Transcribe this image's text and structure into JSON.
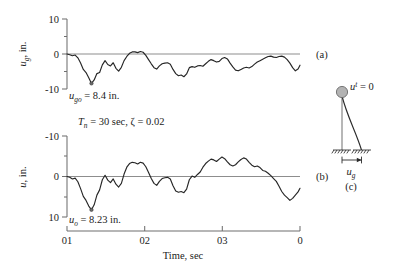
{
  "figure": {
    "title_visible": false,
    "panels": [
      {
        "id": "a",
        "label": "(a)"
      },
      {
        "id": "b",
        "label": "(b)"
      },
      {
        "id": "c",
        "label": "(c)"
      }
    ],
    "xaxis": {
      "label": "Time, sec",
      "tick_labels": [
        "01",
        "02",
        "03",
        "0"
      ],
      "tick_values": [
        0,
        10,
        20,
        30
      ]
    },
    "panel_a": {
      "ylabel_main": "u",
      "ylabel_sub": "g",
      "ylabel_unit": ", in.",
      "ytick_labels": [
        "10",
        "0",
        "-10"
      ],
      "annotation_main": "u",
      "annotation_sub": "go",
      "annotation_rest": " = 8.4 in."
    },
    "panel_b": {
      "ylabel_main": "u",
      "ylabel_unit": ", in.",
      "ytick_labels": [
        "-10",
        "0",
        "10"
      ],
      "annotation_main": "u",
      "annotation_sub": "o",
      "annotation_rest": " = 8.23 in.",
      "params_tn": "T",
      "params_tn_sub": "n",
      "params_tn_rest": " = 30 sec, ",
      "params_zeta": "ζ",
      "params_zeta_rest": " = 0.02"
    },
    "panel_c": {
      "mass_label_main": "u",
      "mass_label_sup": "t",
      "mass_label_rest": " = 0",
      "ground_label_main": "u",
      "ground_label_sub": "g"
    },
    "colors": {
      "curve": "#262626",
      "baseline": "#8d8d8d",
      "axis": "#6f6f6f",
      "mass_fill": "#b3b3b3",
      "text": "#1b1b1b"
    }
  },
  "chart_data": [
    {
      "type": "line",
      "id": "panel_a",
      "title": "Ground displacement history",
      "xlabel": "Time, sec",
      "ylabel": "u_g, in.",
      "xlim": [
        0,
        30
      ],
      "ylim": [
        -10,
        10
      ],
      "y_axis_direction": "normal",
      "ytick_values": [
        10,
        0,
        -10
      ],
      "ytick_labels": [
        "10",
        "0",
        "-10"
      ],
      "grid": false,
      "legend": "none",
      "panel_label": "(a)",
      "annotations": [
        {
          "text": "u_go = 8.4 in.",
          "x": 4.2,
          "y": -8.4,
          "note": "peak ground displacement"
        }
      ],
      "x": [
        0.0,
        0.35,
        0.7,
        1.05,
        1.4,
        1.75,
        2.1,
        2.45,
        2.8,
        3.15,
        3.5,
        3.85,
        4.2,
        4.55,
        4.9,
        5.25,
        5.6,
        5.95,
        6.3,
        6.65,
        7.0,
        7.35,
        7.7,
        8.05,
        8.4,
        8.75,
        9.1,
        9.45,
        9.8,
        10.15,
        10.5,
        10.85,
        11.2,
        11.55,
        11.9,
        12.25,
        12.6,
        12.95,
        13.3,
        13.65,
        14.0,
        14.35,
        14.7,
        15.05,
        15.4,
        15.75,
        16.1,
        16.45,
        16.8,
        17.15,
        17.5,
        17.85,
        18.2,
        18.55,
        18.9,
        19.25,
        19.6,
        19.95,
        20.3,
        20.65,
        21.0,
        21.35,
        21.7,
        22.05,
        22.4,
        22.75,
        23.1,
        23.45,
        23.8,
        24.15,
        24.5,
        24.85,
        25.2,
        25.55,
        25.9,
        26.25,
        26.6,
        26.95,
        27.3,
        27.65,
        28.0,
        28.35,
        28.7,
        29.05,
        29.4,
        29.75,
        30.0
      ],
      "values": [
        0.0,
        -0.2,
        -0.5,
        -0.3,
        -1.1,
        -2.6,
        -4.4,
        -5.3,
        -6.8,
        -8.4,
        -7.4,
        -5.6,
        -5.3,
        -3.1,
        -1.9,
        -3.0,
        -3.4,
        -2.5,
        -4.1,
        -4.9,
        -3.8,
        -1.9,
        -0.7,
        0.2,
        0.6,
        0.6,
        0.4,
        0.7,
        0.5,
        -0.4,
        -1.6,
        -2.8,
        -3.9,
        -4.3,
        -3.4,
        -2.8,
        -2.6,
        -2.5,
        -2.9,
        -4.4,
        -5.6,
        -6.2,
        -6.0,
        -6.5,
        -5.7,
        -3.9,
        -3.6,
        -3.8,
        -3.4,
        -3.3,
        -3.5,
        -2.8,
        -2.1,
        -1.6,
        -1.9,
        -2.3,
        -2.1,
        -1.3,
        -1.0,
        -1.4,
        -2.6,
        -3.7,
        -4.6,
        -4.8,
        -4.4,
        -4.0,
        -3.8,
        -4.0,
        -3.6,
        -2.9,
        -2.3,
        -1.9,
        -1.5,
        -1.1,
        -0.7,
        -0.6,
        -0.9,
        -1.0,
        -0.7,
        -0.6,
        -0.9,
        -1.6,
        -2.6,
        -3.9,
        -4.8,
        -4.3,
        -3.2
      ]
    },
    {
      "type": "line",
      "id": "panel_b",
      "title": "Structural displacement history (T_n = 30 sec, zeta = 0.02)",
      "xlabel": "Time, sec",
      "ylabel": "u, in.",
      "xlim": [
        0,
        30
      ],
      "ylim": [
        -10,
        10
      ],
      "y_axis_direction": "inverted",
      "ytick_values": [
        -10,
        0,
        10
      ],
      "ytick_labels": [
        "-10",
        "0",
        "10"
      ],
      "grid": false,
      "legend": "none",
      "panel_label": "(b)",
      "annotations": [
        {
          "text": "u_o = 8.23 in.",
          "x": 4.2,
          "y": 8.23,
          "note": "peak structural displacement"
        },
        {
          "text": "T_n = 30 sec, zeta = 0.02",
          "x": 8.0,
          "y": -13.0,
          "note": "system parameters"
        }
      ],
      "x": [
        0.0,
        0.35,
        0.7,
        1.05,
        1.4,
        1.75,
        2.1,
        2.45,
        2.8,
        3.15,
        3.5,
        3.85,
        4.2,
        4.55,
        4.9,
        5.25,
        5.6,
        5.95,
        6.3,
        6.65,
        7.0,
        7.35,
        7.7,
        8.05,
        8.4,
        8.75,
        9.1,
        9.45,
        9.8,
        10.15,
        10.5,
        10.85,
        11.2,
        11.55,
        11.9,
        12.25,
        12.6,
        12.95,
        13.3,
        13.65,
        14.0,
        14.35,
        14.7,
        15.05,
        15.4,
        15.75,
        16.1,
        16.45,
        16.8,
        17.15,
        17.5,
        17.85,
        18.2,
        18.55,
        18.9,
        19.25,
        19.6,
        19.95,
        20.3,
        20.65,
        21.0,
        21.35,
        21.7,
        22.05,
        22.4,
        22.75,
        23.1,
        23.45,
        23.8,
        24.15,
        24.5,
        24.85,
        25.2,
        25.55,
        25.9,
        26.25,
        26.6,
        26.95,
        27.3,
        27.65,
        28.0,
        28.35,
        28.7,
        29.05,
        29.4,
        29.75,
        30.0
      ],
      "values": [
        0.0,
        -0.2,
        -0.6,
        -0.4,
        -1.3,
        -3.0,
        -4.9,
        -5.9,
        -7.3,
        -8.23,
        -7.0,
        -4.6,
        -3.3,
        -0.8,
        0.3,
        -0.9,
        -1.5,
        -0.6,
        -1.9,
        -2.6,
        -1.7,
        0.6,
        2.3,
        3.2,
        3.5,
        3.4,
        3.1,
        3.5,
        3.3,
        2.4,
        1.0,
        -0.5,
        -1.7,
        -2.2,
        -1.2,
        -0.5,
        -0.3,
        -0.2,
        -0.6,
        -2.3,
        -3.6,
        -3.9,
        -3.7,
        -4.0,
        -3.1,
        -0.8,
        0.1,
        -0.2,
        0.5,
        1.1,
        2.3,
        3.2,
        3.8,
        4.3,
        4.1,
        3.7,
        4.3,
        4.8,
        4.4,
        3.6,
        2.9,
        2.6,
        2.9,
        3.6,
        4.2,
        4.6,
        4.3,
        3.5,
        2.8,
        2.4,
        2.6,
        2.2,
        1.5,
        1.3,
        0.8,
        0.2,
        -0.5,
        -1.2,
        -2.4,
        -3.7,
        -4.6,
        -5.2,
        -5.9,
        -5.4,
        -4.6,
        -3.8,
        -2.9
      ]
    }
  ]
}
